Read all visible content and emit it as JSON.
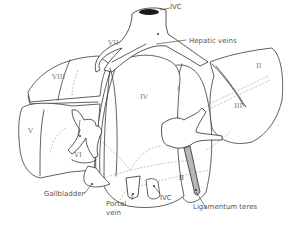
{
  "figure": {
    "labels": {
      "ivc_top": "IVC",
      "hepatic_veins": "Hepatic veins",
      "gallbladder": "Gallbladder",
      "portal_vein": "Portal\nvein",
      "portal_vein_line1": "Portal",
      "portal_vein_line2": "vein",
      "ivc_bottom": "IVC",
      "ligamentum_teres": "Ligamentum teres",
      "b_marker": "B"
    },
    "segments": {
      "s1": "I",
      "s2": "II",
      "s3": "III",
      "s4": "IV",
      "s5": "V",
      "s6": "VI",
      "s7": "VII",
      "s8": "VIII"
    },
    "colors": {
      "line": "#3a3a3a",
      "label_text": "#555555",
      "dashed": "#9a9a9a",
      "ligament_fill": "#b0b0b0"
    }
  }
}
